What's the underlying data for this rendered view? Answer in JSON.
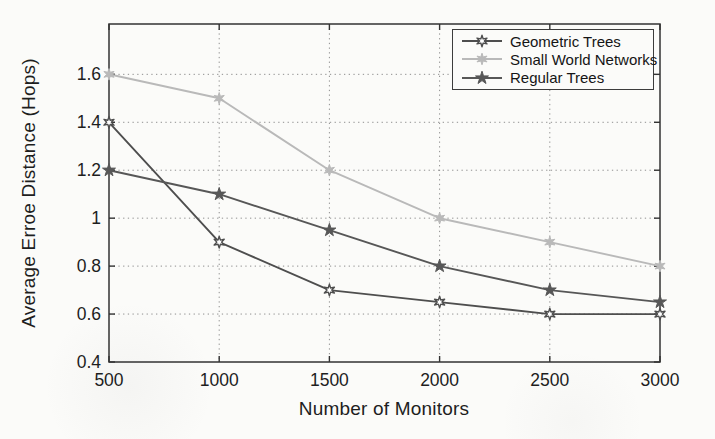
{
  "chart_data": {
    "type": "line",
    "title": "",
    "xlabel": "Number of Monitors",
    "ylabel": "Average Erroe Distance (Hops)",
    "x": [
      500,
      1000,
      1500,
      2000,
      2500,
      3000
    ],
    "series": [
      {
        "name": "Geometric Trees",
        "color": "#4e4e4e",
        "marker": "hexagram-open",
        "values": [
          1.4,
          0.9,
          0.7,
          0.65,
          0.6,
          0.6
        ]
      },
      {
        "name": "Small World Networks",
        "color": "#b9b9b9",
        "marker": "hexagram-filled",
        "values": [
          1.6,
          1.5,
          1.2,
          1.0,
          0.9,
          0.8
        ]
      },
      {
        "name": "Regular Trees",
        "color": "#575757",
        "marker": "star5-filled",
        "values": [
          1.2,
          1.1,
          0.95,
          0.8,
          0.7,
          0.65
        ]
      }
    ],
    "xticks": [
      {
        "value": 500,
        "label": "500"
      },
      {
        "value": 1000,
        "label": "1000"
      },
      {
        "value": 1500,
        "label": "1500"
      },
      {
        "value": 2000,
        "label": "2000"
      },
      {
        "value": 2500,
        "label": "2500"
      },
      {
        "value": 3000,
        "label": "3000"
      }
    ],
    "yticks": [
      {
        "value": 0.4,
        "label": "0.4"
      },
      {
        "value": 0.6,
        "label": "0.6"
      },
      {
        "value": 0.8,
        "label": "0.8"
      },
      {
        "value": 1.0,
        "label": "1"
      },
      {
        "value": 1.2,
        "label": "1.2"
      },
      {
        "value": 1.4,
        "label": "1.4"
      },
      {
        "value": 1.6,
        "label": "1.6"
      }
    ],
    "xlim": [
      500,
      3000
    ],
    "ylim": [
      0.4,
      1.81
    ],
    "grid": true,
    "legend_position": "top-right"
  },
  "style": {
    "background": "#fbfbf9",
    "axis_color": "#333333",
    "grid_color": "#8f8f8f",
    "tick_label_color": "#1e1e1e",
    "legend_border": "#3c3c3c"
  }
}
